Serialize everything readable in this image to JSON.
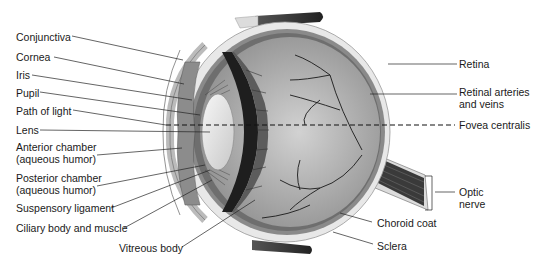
{
  "diagram": {
    "labels_left": [
      {
        "id": "conjunctiva",
        "text": "Conjunctiva",
        "x": 16,
        "y": 28
      },
      {
        "id": "cornea",
        "text": "Cornea",
        "x": 16,
        "y": 50
      },
      {
        "id": "iris",
        "text": "Iris",
        "x": 16,
        "y": 68
      },
      {
        "id": "pupil",
        "text": "Pupil",
        "x": 16,
        "y": 85
      },
      {
        "id": "path-of-light",
        "text": "Path of light",
        "x": 16,
        "y": 103
      },
      {
        "id": "lens",
        "text": "Lens",
        "x": 16,
        "y": 122
      },
      {
        "id": "anterior-chamber",
        "text": "Anterior chamber",
        "text2": "(aqueous humor)",
        "x": 16,
        "y": 139
      },
      {
        "id": "posterior-chamber",
        "text": "Posterior chamber",
        "text2": "(aqueous humor)",
        "x": 16,
        "y": 171
      },
      {
        "id": "suspensory-ligament",
        "text": "Suspensory ligament",
        "x": 16,
        "y": 201
      },
      {
        "id": "ciliary-body",
        "text": "Ciliary body and muscle",
        "x": 16,
        "y": 221
      }
    ],
    "labels_bottom": [
      {
        "id": "vitreous-body",
        "text": "Vitreous body",
        "x": 119,
        "y": 240
      },
      {
        "id": "choroid-coat",
        "text": "Choroid coat",
        "x": 377,
        "y": 218
      },
      {
        "id": "sclera",
        "text": "Sclera",
        "x": 377,
        "y": 240
      }
    ],
    "labels_right": [
      {
        "id": "retina",
        "text": "Retina",
        "x": 459,
        "y": 59
      },
      {
        "id": "retinal-vessels",
        "text": "Retinal arteries",
        "text2": "and veins",
        "x": 459,
        "y": 86
      },
      {
        "id": "fovea-centralis",
        "text": "Fovea centralis",
        "x": 459,
        "y": 119
      },
      {
        "id": "optic-nerve",
        "text": "Optic",
        "text2": "nerve",
        "x": 459,
        "y": 187
      }
    ],
    "colors": {
      "line": "#222222",
      "sclera": "#e6e6e6",
      "choroid": "#8a8a8a",
      "vitreous": "#a9a9a9",
      "lens": "#eeeeee",
      "iris": "#8c8c8c",
      "ciliary_dark": "#2a2a2a"
    }
  }
}
